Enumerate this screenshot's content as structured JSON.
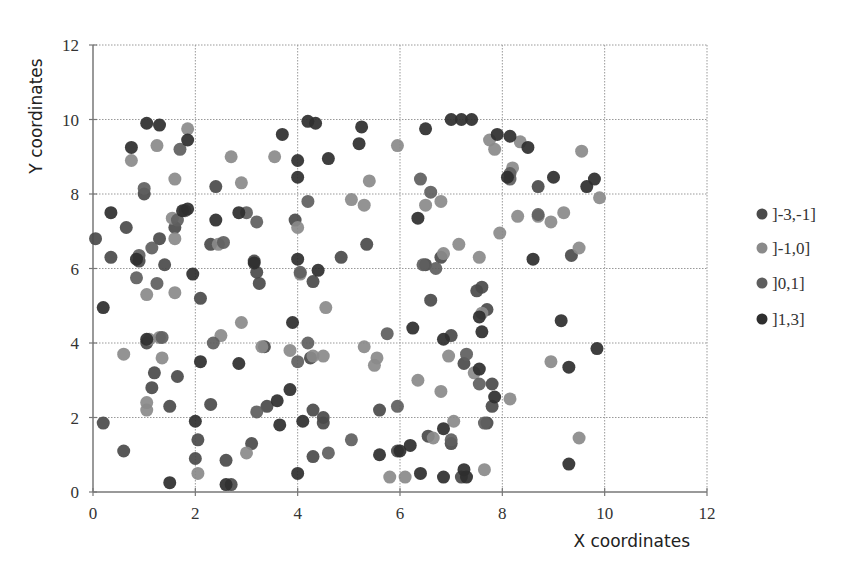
{
  "chart_data": {
    "type": "scatter",
    "title": "",
    "xlabel": "X coordinates",
    "ylabel": "Y coordinates",
    "xlim": [
      0,
      12
    ],
    "ylim": [
      0,
      12
    ],
    "xticks": [
      0,
      2,
      4,
      6,
      8,
      10,
      12
    ],
    "yticks": [
      0,
      2,
      4,
      6,
      8,
      10,
      12
    ],
    "grid": true,
    "legend_position": "right",
    "series": [
      {
        "name": "]-3,-1]",
        "color": "#4a4a4a",
        "points": [
          [
            0.05,
            6.8
          ],
          [
            0.35,
            6.3
          ],
          [
            0.65,
            7.1
          ],
          [
            0.9,
            6.2
          ],
          [
            1.0,
            8.0
          ],
          [
            1.3,
            6.8
          ],
          [
            1.4,
            6.1
          ],
          [
            1.6,
            7.1
          ],
          [
            1.65,
            3.1
          ],
          [
            1.5,
            2.3
          ],
          [
            1.05,
            4.0
          ],
          [
            1.2,
            3.2
          ],
          [
            1.15,
            2.8
          ],
          [
            2.05,
            1.4
          ],
          [
            2.1,
            5.2
          ],
          [
            2.3,
            6.65
          ],
          [
            2.4,
            8.2
          ],
          [
            2.3,
            2.35
          ],
          [
            2.6,
            0.85
          ],
          [
            2.7,
            0.2
          ],
          [
            3.15,
            6.2
          ],
          [
            3.2,
            5.9
          ],
          [
            3.25,
            5.6
          ],
          [
            3.35,
            3.9
          ],
          [
            3.1,
            1.3
          ],
          [
            3.4,
            2.3
          ],
          [
            3.95,
            7.3
          ],
          [
            4.3,
            5.65
          ],
          [
            4.25,
            3.6
          ],
          [
            4.5,
            2.0
          ],
          [
            4.3,
            2.2
          ],
          [
            4.85,
            6.3
          ],
          [
            5.35,
            6.65
          ],
          [
            5.6,
            2.2
          ],
          [
            5.95,
            1.1
          ],
          [
            6.5,
            6.1
          ],
          [
            6.6,
            5.15
          ],
          [
            6.8,
            6.3
          ],
          [
            7.0,
            4.2
          ],
          [
            7.25,
            3.45
          ],
          [
            7.5,
            5.4
          ],
          [
            7.8,
            2.3
          ],
          [
            7.7,
            1.85
          ],
          [
            7.0,
            1.3
          ],
          [
            7.8,
            2.9
          ],
          [
            7.2,
            0.4
          ],
          [
            8.7,
            8.2
          ],
          [
            9.35,
            6.35
          ],
          [
            0.2,
            1.85
          ],
          [
            0.6,
            1.1
          ],
          [
            2.0,
            0.9
          ],
          [
            4.5,
            1.85
          ],
          [
            4.3,
            0.95
          ],
          [
            6.55,
            1.5
          ],
          [
            7.6,
            5.5
          ],
          [
            7.7,
            4.9
          ]
        ]
      },
      {
        "name": "]-1,0]",
        "color": "#8a8a8a",
        "points": [
          [
            0.75,
            8.9
          ],
          [
            1.25,
            9.3
          ],
          [
            1.85,
            9.75
          ],
          [
            1.6,
            8.4
          ],
          [
            1.55,
            7.35
          ],
          [
            1.6,
            6.8
          ],
          [
            1.05,
            5.3
          ],
          [
            1.1,
            4.1
          ],
          [
            1.3,
            4.15
          ],
          [
            1.35,
            3.6
          ],
          [
            1.05,
            2.4
          ],
          [
            1.05,
            2.2
          ],
          [
            0.6,
            3.7
          ],
          [
            2.05,
            0.5
          ],
          [
            2.45,
            6.65
          ],
          [
            2.7,
            9.0
          ],
          [
            2.9,
            8.3
          ],
          [
            2.5,
            4.2
          ],
          [
            2.9,
            4.55
          ],
          [
            3.3,
            3.9
          ],
          [
            3.55,
            9.0
          ],
          [
            3.85,
            3.8
          ],
          [
            3.0,
            1.05
          ],
          [
            4.0,
            7.1
          ],
          [
            4.05,
            5.85
          ],
          [
            4.5,
            3.65
          ],
          [
            4.3,
            3.65
          ],
          [
            4.55,
            4.95
          ],
          [
            5.05,
            7.85
          ],
          [
            5.3,
            7.7
          ],
          [
            5.4,
            8.35
          ],
          [
            5.5,
            3.4
          ],
          [
            5.55,
            3.6
          ],
          [
            5.3,
            3.9
          ],
          [
            5.95,
            9.3
          ],
          [
            6.5,
            7.7
          ],
          [
            6.8,
            7.8
          ],
          [
            6.85,
            6.4
          ],
          [
            6.95,
            3.65
          ],
          [
            6.35,
            3.0
          ],
          [
            6.8,
            2.7
          ],
          [
            6.65,
            1.45
          ],
          [
            7.15,
            6.65
          ],
          [
            7.55,
            6.3
          ],
          [
            7.6,
            4.8
          ],
          [
            7.85,
            9.2
          ],
          [
            7.75,
            9.45
          ],
          [
            7.95,
            6.95
          ],
          [
            8.2,
            8.7
          ],
          [
            8.35,
            9.4
          ],
          [
            8.3,
            7.4
          ],
          [
            8.7,
            7.4
          ],
          [
            8.95,
            7.25
          ],
          [
            9.2,
            7.5
          ],
          [
            9.5,
            6.55
          ],
          [
            9.55,
            9.15
          ],
          [
            9.9,
            7.9
          ],
          [
            8.95,
            3.5
          ],
          [
            8.15,
            2.5
          ],
          [
            9.5,
            1.45
          ],
          [
            7.45,
            3.2
          ],
          [
            7.05,
            1.9
          ],
          [
            7.65,
            0.6
          ],
          [
            5.8,
            0.4
          ],
          [
            6.1,
            0.4
          ],
          [
            1.6,
            5.35
          ]
        ]
      },
      {
        "name": "]0,1]",
        "color": "#5e5e5e",
        "points": [
          [
            1.0,
            8.15
          ],
          [
            1.15,
            6.55
          ],
          [
            1.7,
            9.2
          ],
          [
            1.8,
            7.55
          ],
          [
            1.65,
            7.3
          ],
          [
            1.25,
            5.6
          ],
          [
            0.85,
            5.75
          ],
          [
            0.9,
            6.35
          ],
          [
            2.55,
            6.7
          ],
          [
            2.35,
            4.0
          ],
          [
            3.0,
            7.5
          ],
          [
            3.2,
            7.25
          ],
          [
            4.2,
            7.8
          ],
          [
            4.05,
            5.9
          ],
          [
            4.2,
            4.0
          ],
          [
            4.0,
            3.5
          ],
          [
            4.6,
            1.05
          ],
          [
            3.2,
            2.15
          ],
          [
            5.95,
            2.3
          ],
          [
            6.4,
            8.4
          ],
          [
            6.45,
            6.1
          ],
          [
            6.6,
            8.05
          ],
          [
            6.7,
            6.0
          ],
          [
            7.3,
            3.7
          ],
          [
            7.0,
            1.4
          ],
          [
            7.55,
            2.9
          ],
          [
            8.15,
            8.55
          ],
          [
            8.7,
            7.45
          ],
          [
            8.15,
            8.4
          ],
          [
            5.75,
            4.25
          ],
          [
            5.05,
            1.4
          ],
          [
            7.65,
            1.85
          ],
          [
            1.35,
            4.15
          ]
        ]
      },
      {
        "name": "]1,3]",
        "color": "#2e2e2e",
        "points": [
          [
            0.2,
            4.95
          ],
          [
            0.35,
            7.5
          ],
          [
            0.75,
            9.25
          ],
          [
            0.85,
            6.25
          ],
          [
            1.05,
            4.1
          ],
          [
            1.05,
            9.9
          ],
          [
            1.3,
            9.85
          ],
          [
            1.85,
            9.45
          ],
          [
            1.75,
            7.55
          ],
          [
            1.85,
            7.6
          ],
          [
            2.1,
            3.5
          ],
          [
            2.4,
            7.3
          ],
          [
            2.6,
            0.2
          ],
          [
            2.85,
            7.5
          ],
          [
            2.85,
            3.45
          ],
          [
            3.15,
            6.15
          ],
          [
            3.6,
            2.45
          ],
          [
            3.65,
            1.8
          ],
          [
            3.7,
            9.6
          ],
          [
            3.85,
            2.75
          ],
          [
            3.9,
            4.55
          ],
          [
            4.0,
            8.9
          ],
          [
            4.0,
            8.45
          ],
          [
            4.0,
            6.25
          ],
          [
            4.0,
            0.5
          ],
          [
            4.2,
            9.95
          ],
          [
            4.35,
            9.9
          ],
          [
            4.4,
            5.95
          ],
          [
            4.6,
            8.95
          ],
          [
            5.25,
            9.8
          ],
          [
            5.2,
            9.35
          ],
          [
            5.6,
            1.0
          ],
          [
            6.0,
            1.1
          ],
          [
            6.35,
            7.35
          ],
          [
            6.5,
            9.75
          ],
          [
            6.4,
            0.5
          ],
          [
            6.85,
            4.1
          ],
          [
            6.85,
            1.7
          ],
          [
            6.85,
            0.4
          ],
          [
            7.0,
            10.0
          ],
          [
            7.2,
            10.0
          ],
          [
            7.4,
            10.0
          ],
          [
            7.6,
            4.3
          ],
          [
            7.85,
            2.55
          ],
          [
            7.9,
            9.6
          ],
          [
            8.15,
            9.55
          ],
          [
            8.5,
            9.25
          ],
          [
            8.1,
            8.45
          ],
          [
            8.6,
            6.25
          ],
          [
            9.0,
            8.45
          ],
          [
            9.15,
            4.6
          ],
          [
            9.3,
            3.35
          ],
          [
            9.3,
            0.75
          ],
          [
            9.65,
            8.2
          ],
          [
            9.8,
            8.4
          ],
          [
            9.85,
            3.85
          ],
          [
            7.25,
            0.6
          ],
          [
            7.3,
            0.4
          ],
          [
            7.55,
            3.3
          ],
          [
            7.55,
            4.7
          ],
          [
            4.1,
            1.9
          ],
          [
            2.0,
            1.9
          ],
          [
            1.5,
            0.25
          ],
          [
            1.95,
            5.85
          ],
          [
            6.25,
            4.4
          ],
          [
            6.2,
            1.25
          ]
        ]
      }
    ]
  },
  "legend": {
    "items": [
      {
        "label": "]-3,-1]",
        "color": "#4a4a4a"
      },
      {
        "label": "]-1,0]",
        "color": "#8a8a8a"
      },
      {
        "label": "]0,1]",
        "color": "#5e5e5e"
      },
      {
        "label": "]1,3]",
        "color": "#2e2e2e"
      }
    ]
  },
  "axes": {
    "xlabel": "X coordinates",
    "ylabel": "Y coordinates",
    "xticks": [
      "0",
      "2",
      "4",
      "6",
      "8",
      "10",
      "12"
    ],
    "yticks": [
      "0",
      "2",
      "4",
      "6",
      "8",
      "10",
      "12"
    ]
  }
}
